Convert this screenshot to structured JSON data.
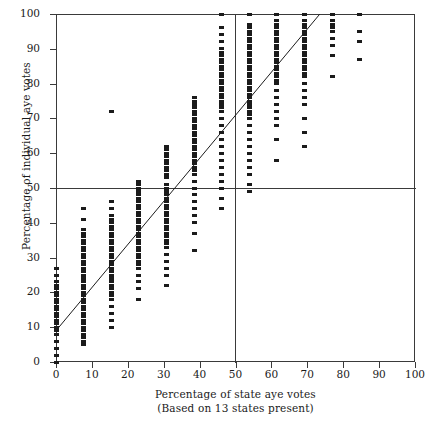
{
  "chart_data": {
    "type": "scatter",
    "title": "",
    "xlabel": "Percentage of state aye votes",
    "xlabel_sub": "(Based on 13 states present)",
    "ylabel": "Percentage of individual aye votes",
    "xlim": [
      0,
      100
    ],
    "ylim": [
      0,
      100
    ],
    "xticks": [
      0,
      10,
      20,
      30,
      40,
      50,
      60,
      70,
      80,
      90,
      100
    ],
    "yticks": [
      0,
      10,
      20,
      30,
      40,
      50,
      60,
      70,
      80,
      90,
      100
    ],
    "grid": false,
    "legend": null,
    "reference_lines": [
      {
        "orientation": "horizontal",
        "value": 50
      },
      {
        "orientation": "vertical",
        "value": 50
      }
    ],
    "fit_line": {
      "x0": 0,
      "y0": 9,
      "x1": 73.5,
      "y1": 100
    },
    "marker": {
      "shape": "square",
      "color": "#1b1b1b",
      "width_px": 5,
      "height_px": 3
    },
    "note": "x values are discrete multiples of 1/13 (7.69%) of 13 states present",
    "series": [
      {
        "name": "roll-call votes",
        "columns": [
          {
            "x": 0.0,
            "y": [
              0,
              2,
              4,
              6,
              8,
              9,
              10,
              11,
              12,
              13,
              14,
              15,
              16,
              17,
              18,
              19,
              20,
              21,
              22,
              23,
              25,
              27
            ]
          },
          {
            "x": 7.7,
            "y": [
              5,
              6,
              7,
              8,
              9,
              10,
              11,
              12,
              13,
              14,
              15,
              16,
              17,
              18,
              19,
              20,
              21,
              22,
              23,
              24,
              25,
              26,
              27,
              28,
              29,
              30,
              31,
              32,
              33,
              34,
              35,
              36,
              37,
              38,
              41,
              44
            ]
          },
          {
            "x": 15.4,
            "y": [
              10,
              12,
              14,
              16,
              18,
              19,
              20,
              21,
              22,
              23,
              24,
              25,
              26,
              27,
              28,
              29,
              30,
              31,
              32,
              33,
              34,
              35,
              36,
              37,
              38,
              39,
              40,
              41,
              42,
              44,
              46
            ]
          },
          {
            "x": 23.1,
            "y": [
              18,
              21,
              23,
              25,
              27,
              28,
              29,
              30,
              31,
              32,
              33,
              34,
              35,
              36,
              37,
              38,
              39,
              40,
              41,
              42,
              43,
              44,
              45,
              46,
              47,
              48,
              49,
              50,
              51,
              52
            ]
          },
          {
            "x": 30.8,
            "y": [
              22,
              25,
              27,
              29,
              31,
              33,
              34,
              35,
              36,
              37,
              38,
              39,
              40,
              41,
              42,
              43,
              44,
              45,
              46,
              47,
              48,
              49,
              50,
              51,
              53,
              54,
              55,
              56,
              57,
              58,
              59,
              60,
              61,
              62
            ]
          },
          {
            "x": 38.5,
            "y": [
              32,
              37,
              40,
              42,
              44,
              46,
              48,
              50,
              52,
              54,
              55,
              56,
              57,
              58,
              59,
              60,
              61,
              62,
              63,
              64,
              65,
              66,
              67,
              68,
              69,
              70,
              71,
              72,
              73,
              74,
              75,
              76
            ]
          },
          {
            "x": 46.2,
            "y": [
              44,
              47,
              50,
              52,
              54,
              56,
              58,
              60,
              62,
              64,
              66,
              68,
              70,
              72,
              73,
              74,
              75,
              76,
              77,
              78,
              79,
              80,
              81,
              82,
              83,
              84,
              85,
              86,
              87,
              88,
              89,
              90,
              92,
              94,
              96,
              100
            ]
          },
          {
            "x": 53.8,
            "y": [
              49,
              51,
              54,
              56,
              58,
              60,
              62,
              64,
              66,
              68,
              70,
              71,
              72,
              73,
              74,
              75,
              76,
              77,
              78,
              79,
              80,
              81,
              82,
              83,
              84,
              85,
              86,
              87,
              88,
              89,
              90,
              91,
              92,
              93,
              94,
              95,
              96,
              97,
              100
            ]
          },
          {
            "x": 61.5,
            "y": [
              58,
              64,
              68,
              70,
              72,
              74,
              76,
              78,
              80,
              81,
              82,
              83,
              84,
              85,
              86,
              87,
              88,
              89,
              90,
              91,
              92,
              93,
              94,
              95,
              96,
              97,
              98,
              100
            ]
          },
          {
            "x": 69.2,
            "y": [
              62,
              66,
              70,
              74,
              76,
              78,
              80,
              82,
              83,
              84,
              85,
              86,
              87,
              88,
              89,
              90,
              91,
              92,
              93,
              94,
              95,
              96,
              97,
              98,
              100
            ]
          },
          {
            "x": 76.9,
            "y": [
              82,
              88,
              91,
              93,
              95,
              96,
              97,
              98,
              100
            ]
          },
          {
            "x": 84.6,
            "y": [
              87,
              92,
              95,
              100
            ]
          }
        ]
      },
      {
        "name": "outlier",
        "columns": [
          {
            "x": 15.4,
            "y": [
              72
            ]
          }
        ]
      }
    ]
  }
}
